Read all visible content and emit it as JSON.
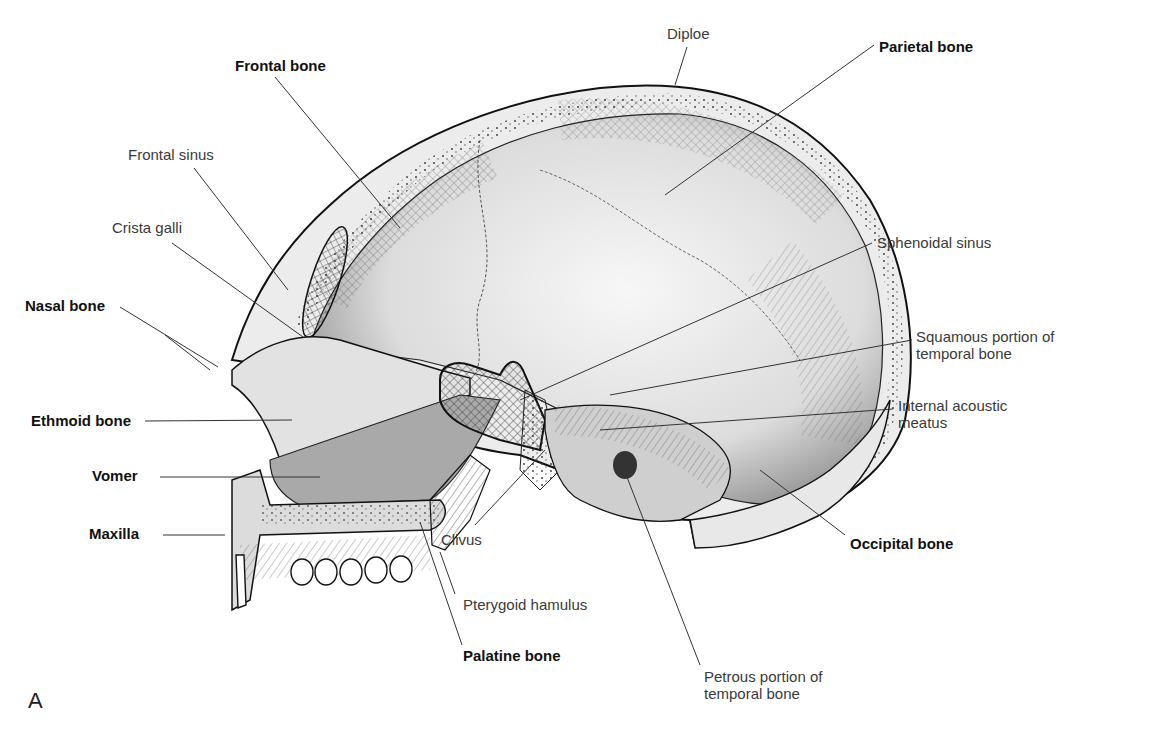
{
  "figure": {
    "panel_letter": "A",
    "labels": [
      {
        "id": "diploe",
        "text": "Diploe",
        "bold": false,
        "x": 667,
        "y": 25
      },
      {
        "id": "parietal-bone",
        "text": "Parietal bone",
        "bold": true,
        "x": 879,
        "y": 38
      },
      {
        "id": "frontal-bone",
        "text": "Frontal bone",
        "bold": true,
        "x": 235,
        "y": 57
      },
      {
        "id": "frontal-sinus",
        "text": "Frontal sinus",
        "bold": false,
        "x": 128,
        "y": 146
      },
      {
        "id": "crista-galli",
        "text": "Crista galli",
        "bold": false,
        "x": 112,
        "y": 219
      },
      {
        "id": "sphenoidal-sinus",
        "text": "Sphenoidal sinus",
        "bold": false,
        "x": 877,
        "y": 234
      },
      {
        "id": "nasal-bone",
        "text": "Nasal bone",
        "bold": true,
        "x": 25,
        "y": 297
      },
      {
        "id": "squamous-temporal",
        "text": "Squamous portion of\ntemporal bone",
        "bold": false,
        "x": 916,
        "y": 328
      },
      {
        "id": "internal-acoustic-meatus",
        "text": "Internal acoustic\nmeatus",
        "bold": false,
        "x": 898,
        "y": 397
      },
      {
        "id": "ethmoid-bone",
        "text": "Ethmoid bone",
        "bold": true,
        "x": 31,
        "y": 412
      },
      {
        "id": "vomer",
        "text": "Vomer",
        "bold": true,
        "x": 92,
        "y": 467
      },
      {
        "id": "maxilla",
        "text": "Maxilla",
        "bold": true,
        "x": 89,
        "y": 525
      },
      {
        "id": "clivus",
        "text": "Clivus",
        "bold": false,
        "x": 441,
        "y": 531
      },
      {
        "id": "occipital-bone",
        "text": "Occipital bone",
        "bold": true,
        "x": 850,
        "y": 535
      },
      {
        "id": "pterygoid-hamulus",
        "text": "Pterygoid hamulus",
        "bold": false,
        "x": 463,
        "y": 596
      },
      {
        "id": "palatine-bone",
        "text": "Palatine bone",
        "bold": true,
        "x": 463,
        "y": 647
      },
      {
        "id": "petrous-temporal",
        "text": "Petrous portion of\ntemporal bone",
        "bold": false,
        "x": 704,
        "y": 668
      }
    ]
  },
  "colors": {
    "background": "#ffffff",
    "bone_fill": "#e9e9e9",
    "bone_dark": "#bdbdbd",
    "outline": "#1a1a1a",
    "leader": "#333333",
    "label": "#222222"
  }
}
